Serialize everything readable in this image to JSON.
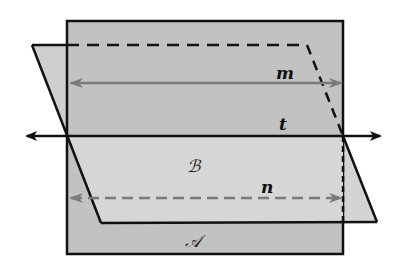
{
  "diagram": {
    "type": "geometry-planes",
    "planes": [
      {
        "id": "plane-A",
        "label": "𝒜",
        "fill": "#c4c4c4",
        "stroke": "#111111"
      },
      {
        "id": "plane-B",
        "label": "ℬ",
        "fill": "#d6d6d6",
        "stroke": "#111111"
      }
    ],
    "lines": [
      {
        "id": "line-m",
        "label": "m",
        "color": "#7a7a7a",
        "style": "solid",
        "arrows": "both"
      },
      {
        "id": "line-t",
        "label": "t",
        "color": "#111111",
        "style": "solid",
        "arrows": "both"
      },
      {
        "id": "line-n",
        "label": "n",
        "color": "#7a7a7a",
        "style": "dashed",
        "arrows": "both"
      }
    ]
  },
  "labels": {
    "m": "m",
    "t": "t",
    "n": "n",
    "B": "ℬ",
    "A": "𝒜"
  },
  "colors": {
    "plane_A": "#c4c4c4",
    "plane_B": "#d8d8d8",
    "overlap": "#cfcfcf",
    "edge": "#111111",
    "gray_line": "#7a7a7a"
  }
}
